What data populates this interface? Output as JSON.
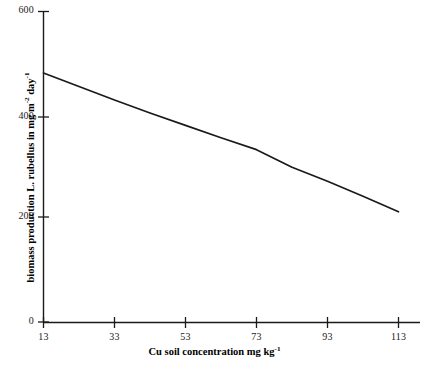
{
  "chart_data": {
    "type": "line",
    "title": "",
    "xlabel": "Cu soil concentration mg kg-1",
    "ylabel": "biomass production L. rubellus in mg m-2 day-1",
    "xlabel_parts": {
      "base": "Cu soil concentration mg kg",
      "sup": "-1"
    },
    "ylabel_parts": {
      "base1": "biomass production L. rubellus in mg m",
      "sup1": "-2",
      "base2": " day",
      "sup2": "-1"
    },
    "x_ticks": [
      13,
      33,
      53,
      73,
      93,
      113
    ],
    "x_tick_labels": [
      "13",
      "33",
      "53",
      "73",
      "93",
      "113"
    ],
    "y_ticks": [
      0,
      200,
      400,
      600
    ],
    "y_tick_labels": [
      "0",
      "200",
      "400",
      "600"
    ],
    "xlim": [
      13,
      119
    ],
    "ylim": [
      0,
      600
    ],
    "grid": false,
    "legend": null,
    "series": [
      {
        "name": "biomass production L. rubellus",
        "color": "#1a1a1a",
        "x": [
          13,
          23,
          33,
          43,
          53,
          63,
          73,
          83,
          93,
          103,
          113
        ],
        "values": [
          481,
          455,
          429,
          404,
          380,
          356,
          333,
          299,
          272,
          243,
          213
        ]
      }
    ]
  },
  "axis": {
    "x_title": "Cu soil concentration mg kg",
    "x_title_sup": "-1",
    "y_title_a": "biomass production L. rubellus in mg m",
    "y_title_sup_a": "-2",
    "y_title_b": " day",
    "y_title_sup_b": "-1"
  }
}
